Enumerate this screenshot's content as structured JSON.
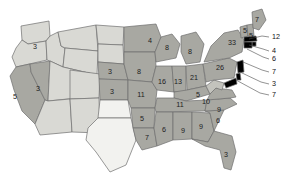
{
  "figure": {
    "kind": "choropleth-map",
    "region": "United States",
    "background": "#ffffff",
    "border_color": "#6f6f6f",
    "label_color": "#1c1c1c"
  },
  "legend_scale": {
    "bins": [
      {
        "name": "none",
        "fill": "#f2f2ef"
      },
      {
        "name": "low",
        "fill": "#d9d9d4"
      },
      {
        "name": "mid",
        "fill": "#c3c3bd"
      },
      {
        "name": "high",
        "fill": "#a8a8a2"
      },
      {
        "name": "highest",
        "fill": "#8f8f89"
      }
    ]
  },
  "chart_data": {
    "type": "map",
    "title": "",
    "xlabel": "",
    "ylabel": "",
    "value_field": "value",
    "states": [
      {
        "code": "WA",
        "name": "Washington",
        "value": 3,
        "label": "3",
        "fill": "#d9d9d4",
        "label_x": 35,
        "label_y": 47
      },
      {
        "code": "OR",
        "name": "Oregon",
        "value": null,
        "label": "",
        "fill": "#d9d9d4",
        "label_x": 24,
        "label_y": 69
      },
      {
        "code": "CA",
        "name": "California",
        "value": 5,
        "label": "5",
        "fill": "#a8a8a2",
        "label_x": 15,
        "label_y": 97
      },
      {
        "code": "NV",
        "name": "Nevada",
        "value": 3,
        "label": "3",
        "fill": "#a8a8a2",
        "label_x": 38,
        "label_y": 89
      },
      {
        "code": "ID",
        "name": "Idaho",
        "value": null,
        "label": "",
        "fill": "#d9d9d4",
        "label_x": 51,
        "label_y": 55
      },
      {
        "code": "MT",
        "name": "Montana",
        "value": null,
        "label": "",
        "fill": "#d9d9d4",
        "label_x": 76,
        "label_y": 40
      },
      {
        "code": "WY",
        "name": "Wyoming",
        "value": null,
        "label": "",
        "fill": "#d9d9d4",
        "label_x": 78,
        "label_y": 65
      },
      {
        "code": "UT",
        "name": "Utah",
        "value": null,
        "label": "",
        "fill": "#d9d9d4",
        "label_x": 55,
        "label_y": 85
      },
      {
        "code": "AZ",
        "name": "Arizona",
        "value": null,
        "label": "",
        "fill": "#d9d9d4",
        "label_x": 52,
        "label_y": 115
      },
      {
        "code": "CO",
        "name": "Colorado",
        "value": null,
        "label": "",
        "fill": "#d9d9d4",
        "label_x": 83,
        "label_y": 87
      },
      {
        "code": "NM",
        "name": "New Mexico",
        "value": null,
        "label": "",
        "fill": "#d9d9d4",
        "label_x": 80,
        "label_y": 115
      },
      {
        "code": "ND",
        "name": "North Dakota",
        "value": null,
        "label": "",
        "fill": "#d9d9d4",
        "label_x": 108,
        "label_y": 38
      },
      {
        "code": "SD",
        "name": "South Dakota",
        "value": null,
        "label": "",
        "fill": "#d9d9d4",
        "label_x": 108,
        "label_y": 55
      },
      {
        "code": "NE",
        "name": "Nebraska",
        "value": 3,
        "label": "3",
        "fill": "#a8a8a2",
        "label_x": 110,
        "label_y": 72
      },
      {
        "code": "KS",
        "name": "Kansas",
        "value": 3,
        "label": "3",
        "fill": "#a8a8a2",
        "label_x": 112,
        "label_y": 92
      },
      {
        "code": "OK",
        "name": "Oklahoma",
        "value": null,
        "label": "",
        "fill": "#f2f2ef",
        "label_x": 114,
        "label_y": 112
      },
      {
        "code": "TX",
        "name": "Texas",
        "value": null,
        "label": "",
        "fill": "#f2f2ef",
        "label_x": 108,
        "label_y": 142
      },
      {
        "code": "MN",
        "name": "Minnesota",
        "value": 4,
        "label": "4",
        "fill": "#a8a8a2",
        "label_x": 150,
        "label_y": 41
      },
      {
        "code": "IA",
        "name": "Iowa",
        "value": 8,
        "label": "8",
        "fill": "#a8a8a2",
        "label_x": 139,
        "label_y": 72
      },
      {
        "code": "MO",
        "name": "Missouri",
        "value": 11,
        "label": "11",
        "fill": "#a8a8a2",
        "label_x": 141,
        "label_y": 95
      },
      {
        "code": "AR",
        "name": "Arkansas",
        "value": 5,
        "label": "5",
        "fill": "#a8a8a2",
        "label_x": 142,
        "label_y": 119
      },
      {
        "code": "LA",
        "name": "Louisiana",
        "value": 7,
        "label": "7",
        "fill": "#a8a8a2",
        "label_x": 147,
        "label_y": 138
      },
      {
        "code": "WI",
        "name": "Wisconsin",
        "value": 8,
        "label": "8",
        "fill": "#a8a8a2",
        "label_x": 167,
        "label_y": 48
      },
      {
        "code": "IL",
        "name": "Illinois",
        "value": 16,
        "label": "16",
        "fill": "#a8a8a2",
        "label_x": 162,
        "label_y": 82
      },
      {
        "code": "MI",
        "name": "Michigan",
        "value": 8,
        "label": "8",
        "fill": "#a8a8a2",
        "label_x": 190,
        "label_y": 52
      },
      {
        "code": "IN",
        "name": "Indiana",
        "value": 13,
        "label": "13",
        "fill": "#a8a8a2",
        "label_x": 178,
        "label_y": 82
      },
      {
        "code": "OH",
        "name": "Ohio",
        "value": 21,
        "label": "21",
        "fill": "#a8a8a2",
        "label_x": 194,
        "label_y": 78
      },
      {
        "code": "KY",
        "name": "Kentucky",
        "value": 5,
        "label": "5",
        "fill": "#a8a8a2",
        "label_x": 198,
        "label_y": 95
      },
      {
        "code": "TN",
        "name": "Tennessee",
        "value": 11,
        "label": "11",
        "fill": "#a8a8a2",
        "label_x": 180,
        "label_y": 105
      },
      {
        "code": "MS",
        "name": "Mississippi",
        "value": 6,
        "label": "6",
        "fill": "#a8a8a2",
        "label_x": 164,
        "label_y": 130
      },
      {
        "code": "AL",
        "name": "Alabama",
        "value": 9,
        "label": "9",
        "fill": "#a8a8a2",
        "label_x": 183,
        "label_y": 131
      },
      {
        "code": "GA",
        "name": "Georgia",
        "value": 9,
        "label": "9",
        "fill": "#a8a8a2",
        "label_x": 201,
        "label_y": 127
      },
      {
        "code": "FL",
        "name": "Florida",
        "value": 3,
        "label": "3",
        "fill": "#a8a8a2",
        "label_x": 226,
        "label_y": 155
      },
      {
        "code": "SC",
        "name": "South Carolina",
        "value": 6,
        "label": "6",
        "fill": "#a8a8a2",
        "label_x": 218,
        "label_y": 121
      },
      {
        "code": "NC",
        "name": "North Carolina",
        "value": 9,
        "label": "9",
        "fill": "#a8a8a2",
        "label_x": 219,
        "label_y": 110
      },
      {
        "code": "VA",
        "name": "Virginia",
        "value": 10,
        "label": "10",
        "fill": "#a8a8a2",
        "label_x": 206,
        "label_y": 102
      },
      {
        "code": "WV",
        "name": "West Virginia",
        "value": null,
        "label": "",
        "fill": "#c3c3bd",
        "label_x": 205,
        "label_y": 90
      },
      {
        "code": "PA",
        "name": "Pennsylvania",
        "value": 26,
        "label": "26",
        "fill": "#a8a8a2",
        "label_x": 220,
        "label_y": 68
      },
      {
        "code": "NY",
        "name": "New York",
        "value": 33,
        "label": "33",
        "fill": "#a8a8a2",
        "label_x": 232,
        "label_y": 43
      },
      {
        "code": "VT",
        "name": "Vermont",
        "value": null,
        "label": "5",
        "fill": "#a8a8a2",
        "label_x": 245,
        "label_y": 31
      },
      {
        "code": "ME",
        "name": "Maine",
        "value": 7,
        "label": "7",
        "fill": "#a8a8a2",
        "label_x": 257,
        "label_y": 20
      },
      {
        "code": "NH",
        "name": "New Hampshire",
        "value": null,
        "label": "5",
        "fill": "#a8a8a2",
        "label_x": 251,
        "label_y": 36
      }
    ],
    "callouts": [
      {
        "id": "callout-1",
        "label": "12",
        "target_state": "MA",
        "num_x": 272,
        "num_y": 37,
        "line": "M 249,39 L 262,36 L 269,37"
      },
      {
        "id": "callout-2",
        "label": "4",
        "target_state": "RI",
        "num_x": 272,
        "num_y": 51,
        "line": "M 249,45 L 263,49 L 269,51"
      },
      {
        "id": "callout-3",
        "label": "6",
        "target_state": "CT",
        "num_x": 272,
        "num_y": 59,
        "line": "M 247,49 L 263,57 L 269,59"
      },
      {
        "id": "callout-4",
        "label": "7",
        "target_state": "NJ",
        "num_x": 272,
        "num_y": 72,
        "line": "M 243,62 L 262,70 L 269,72"
      },
      {
        "id": "callout-5",
        "label": "3",
        "target_state": "DE",
        "num_x": 272,
        "num_y": 84,
        "line": "M 240,72 L 261,82 L 269,84"
      },
      {
        "id": "callout-6",
        "label": "7",
        "target_state": "MD",
        "num_x": 272,
        "num_y": 95,
        "line": "M 236,80 L 260,93 L 269,95"
      }
    ]
  }
}
